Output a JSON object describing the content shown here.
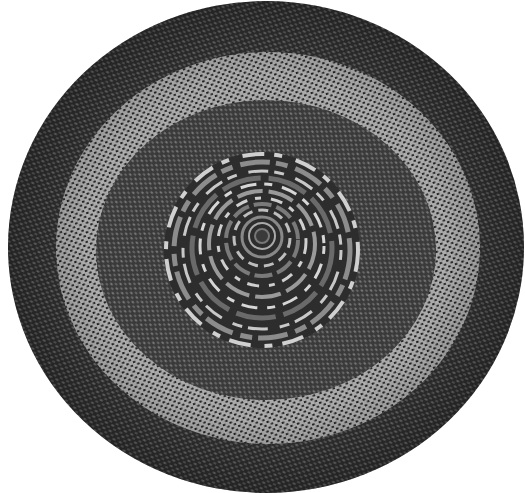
{
  "image": {
    "description": "Black-and-white photograph of a round braided rug with concentric bands and a coiled center",
    "background": "#ffffff",
    "rug": {
      "center_x": 266,
      "center_y": 247,
      "radius_x": 258,
      "radius_y": 246,
      "colors": {
        "outer_band": "#3a3a3a",
        "light_band": "#8a8a8a",
        "inner_band": "#454545",
        "center_coil": "#2e2e2e",
        "highlight": "#d8d8d8"
      },
      "bands": [
        {
          "name": "outer-dark-band",
          "r_outer": 1.0,
          "r_inner": 0.82
        },
        {
          "name": "light-band",
          "r_outer": 0.82,
          "r_inner": 0.62
        },
        {
          "name": "inner-dark-band",
          "r_outer": 0.62,
          "r_inner": 0.38
        },
        {
          "name": "coiled-center",
          "r_outer": 0.38,
          "r_inner": 0
        }
      ]
    }
  }
}
